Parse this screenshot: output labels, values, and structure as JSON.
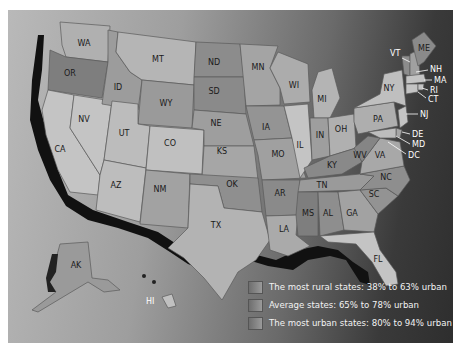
{
  "map": {
    "title": "U.S. states by percent urban population",
    "colors": {
      "rural": "#7e7e7e",
      "average": "#a6a6a6",
      "urban": "#c4c4c4",
      "coast_shadow": "#111111"
    },
    "state_labels": {
      "WA": "WA",
      "OR": "OR",
      "CA": "CA",
      "NV": "NV",
      "ID": "ID",
      "MT": "MT",
      "WY": "WY",
      "UT": "UT",
      "AZ": "AZ",
      "CO": "CO",
      "NM": "NM",
      "ND": "ND",
      "SD": "SD",
      "NE": "NE",
      "KS": "KS",
      "OK": "OK",
      "TX": "TX",
      "MN": "MN",
      "IA": "IA",
      "MO": "MO",
      "AR": "AR",
      "LA": "LA",
      "WI": "WI",
      "IL": "IL",
      "MI": "MI",
      "IN": "IN",
      "OH": "OH",
      "KY": "KY",
      "TN": "TN",
      "MS": "MS",
      "AL": "AL",
      "GA": "GA",
      "FL": "FL",
      "SC": "SC",
      "NC": "NC",
      "VA": "VA",
      "WV": "WV",
      "PA": "PA",
      "NY": "NY",
      "VT": "VT",
      "NH": "NH",
      "ME": "ME",
      "MA": "MA",
      "RI": "RI",
      "CT": "CT",
      "NJ": "NJ",
      "DE": "DE",
      "MD": "MD",
      "DC": "DC",
      "AK": "AK",
      "HI": "HI"
    }
  },
  "legend": {
    "items": [
      {
        "label": "The most rural states: 38% to 63% urban"
      },
      {
        "label": "Average states: 65% to 78% urban"
      },
      {
        "label": "The most urban states: 80% to 94% urban"
      }
    ]
  }
}
